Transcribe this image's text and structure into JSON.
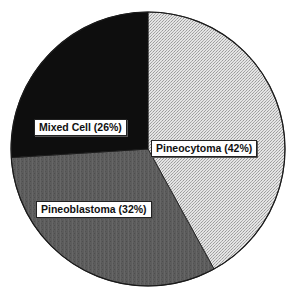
{
  "chart_data": {
    "type": "pie",
    "title": "",
    "categories": [
      "Pineocytoma",
      "Pineoblastoma",
      "Mixed Cell"
    ],
    "values": [
      42,
      32,
      26
    ],
    "unit": "%",
    "start_angle_deg": 0,
    "direction": "clockwise",
    "labels": [
      "Pineocytoma (42%)",
      "Pineoblastoma (32%)",
      "Mixed Cell (26%)"
    ],
    "colors": [
      "#d6d6d6",
      "#5a5a5a",
      "#0e0e0e"
    ],
    "fill_styles": [
      "light-stipple",
      "medium-gray-texture",
      "black"
    ],
    "legend": "none",
    "grid": false
  },
  "labels": {
    "pineocytoma": "Pineocytoma (42%)",
    "pineoblastoma": "Pineoblastoma (32%)",
    "mixed_cell": "Mixed Cell (26%)"
  }
}
